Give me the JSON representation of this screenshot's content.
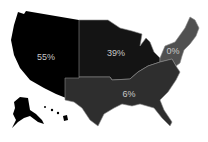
{
  "map": {
    "type": "choropleth",
    "regions": [
      {
        "id": "west",
        "name": "West",
        "value": "55%",
        "color": "#000000"
      },
      {
        "id": "midwest",
        "name": "Midwest",
        "value": "39%",
        "color": "#141414"
      },
      {
        "id": "northeast",
        "name": "Northeast",
        "value": "0%",
        "color": "#505050"
      },
      {
        "id": "south",
        "name": "South",
        "value": "6%",
        "color": "#2e2e2e"
      }
    ],
    "border_color": "#8a8a8a"
  }
}
